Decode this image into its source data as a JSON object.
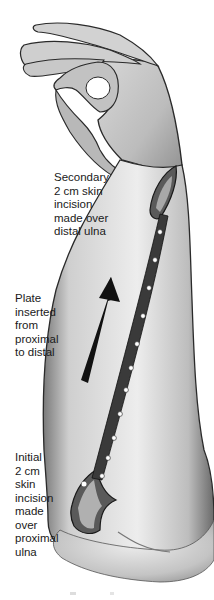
{
  "labels": {
    "secondary_incision": "Secondary\n2 cm skin\nincision\nmade over\ndistal ulna",
    "plate_direction": "Plate\ninserted\nfrom\nproximal\nto distal",
    "initial_incision": "Initial\n2 cm\nskin\nincision\nmade\nover\nproximal\nulna"
  },
  "colors": {
    "background": "#ffffff",
    "skin_light": "#e6e6e6",
    "skin_shadow": "#8a8a8a",
    "outline": "#2a2a2a",
    "plate": "#3a3a3a",
    "screw_hole": "#ffffff",
    "arrow": "#111111"
  },
  "illustration": {
    "plate_holes": 11
  }
}
